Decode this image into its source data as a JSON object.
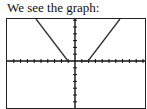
{
  "caption": "We see the graph:",
  "chart_data": {
    "type": "line",
    "title": "",
    "xlabel": "",
    "ylabel": "",
    "xlim": [
      -10,
      10
    ],
    "ylim": [
      -7,
      6
    ],
    "grid": false,
    "legend": null,
    "axis_ticks": "tick marks every 1 unit, no labels",
    "series": [
      {
        "name": "left branch",
        "x": [
          -5.6,
          -1
        ],
        "y": [
          6,
          0
        ]
      },
      {
        "name": "flat segment",
        "x": [
          1,
          2
        ],
        "y": [
          0,
          0
        ]
      },
      {
        "name": "right branch",
        "x": [
          2,
          6.4
        ],
        "y": [
          0,
          6
        ]
      }
    ]
  }
}
